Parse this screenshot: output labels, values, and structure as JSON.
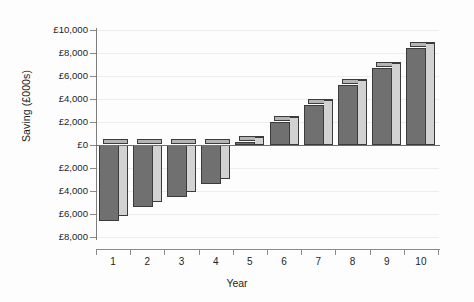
{
  "chart_data": {
    "type": "bar",
    "title": "",
    "subtitle": "",
    "xlabel": "Year",
    "ylabel": "Saving (£000s)",
    "categories": [
      "1",
      "2",
      "3",
      "4",
      "5",
      "6",
      "7",
      "8",
      "9",
      "10"
    ],
    "values": [
      -6600,
      -5400,
      -4500,
      -3400,
      300,
      2000,
      3500,
      5200,
      6700,
      8400
    ],
    "series": [
      {
        "name": "Saving",
        "values": [
          -6600,
          -5400,
          -4500,
          -3400,
          300,
          2000,
          3500,
          5200,
          6700,
          8400
        ]
      }
    ],
    "ylim": [
      -8000,
      10000
    ],
    "ytick_values": [
      10000,
      8000,
      6000,
      4000,
      2000,
      0,
      -2000,
      -4000,
      -6000,
      -8000
    ],
    "ytick_labels": [
      "£10,000",
      "£8,000",
      "£6,000",
      "£4,000",
      "£2,000",
      "£0",
      "£2,000",
      "£4,000",
      "£6,000",
      "£8,000"
    ],
    "xtick_labels": [
      "1",
      "2",
      "3",
      "4",
      "5",
      "6",
      "7",
      "8",
      "9",
      "10"
    ],
    "grid": true,
    "grid_axis": "y",
    "legend": "none",
    "legend_position": "none",
    "bar_style": "3d",
    "colors": {
      "bar_front": "#707070",
      "bar_side": "#d2d2d2",
      "bar_top": "#b4b4b4",
      "bar_outline": "#3b3b3b",
      "axis": "#7d7d7d",
      "grid": "#ededed",
      "text": "#1d1d1d",
      "background": "#fdfdfd"
    },
    "annotations": []
  }
}
